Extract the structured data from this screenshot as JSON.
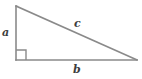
{
  "figure": {
    "kind": "right-triangle-diagram",
    "background_color": "#ffffff",
    "stroke_color": "#8a8a8a",
    "label_color": "#3d3d3d",
    "stroke_width": 1.6,
    "labels": {
      "leg_vertical": "a",
      "leg_horizontal": "b",
      "hypotenuse": "c"
    },
    "geometry": {
      "apex_top": [
        16,
        6
      ],
      "vertex_right_angle": [
        16,
        60
      ],
      "vertex_right": [
        137,
        60
      ],
      "right_angle_marker_size": 10
    }
  }
}
